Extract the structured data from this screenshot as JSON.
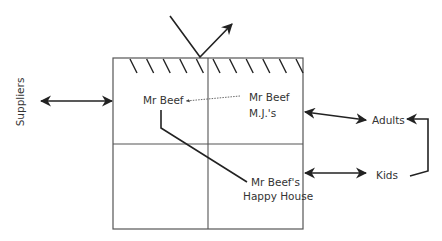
{
  "diagram": {
    "type": "positioning-map",
    "quadrant_labels": {
      "top_left": "Mr Beef",
      "top_right_line1": "Mr Beef",
      "top_right_line2": "M.J.'s",
      "bottom_right_line1": "Mr Beef's",
      "bottom_right_line2": "Happy House"
    },
    "external_labels": {
      "left": "Suppliers",
      "right_top": "Adults",
      "right_bottom": "Kids"
    },
    "connections": [
      {
        "from": "Mr Beef M.J.'s",
        "to": "Mr Beef",
        "style": "dotted-arrow"
      },
      {
        "from": "Mr Beef",
        "to": "Mr Beef's Happy House",
        "style": "solid-line"
      },
      {
        "from": "Suppliers",
        "to": "box-left-edge",
        "style": "double-arrow"
      },
      {
        "from": "box-right-edge",
        "to": "Adults",
        "style": "double-arrow"
      },
      {
        "from": "box-right-edge",
        "to": "Kids",
        "style": "double-arrow"
      },
      {
        "from": "Kids",
        "to": "Adults",
        "style": "bracket-arrow"
      },
      {
        "from": "top-hatched-edge",
        "to": "outside",
        "style": "reflected-arrow"
      }
    ],
    "colors": {
      "line": "#222222",
      "border": "#555555",
      "text": "#333333"
    }
  }
}
